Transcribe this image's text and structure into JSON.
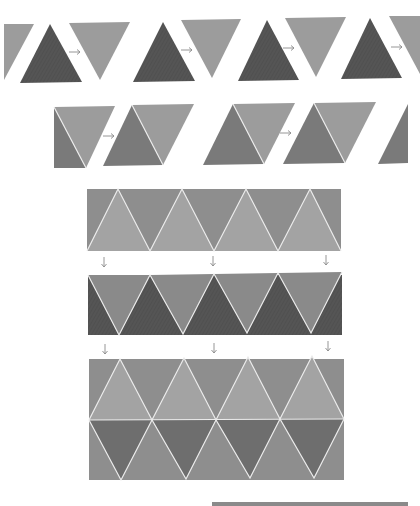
{
  "diagram": {
    "colors": {
      "light_gray": "#9c9c9c",
      "mid_gray": "#8a8a8a",
      "medium_dark": "#7a7a7a",
      "dark_gray": "#565656",
      "lighter_gray": "#a3a3a3",
      "edge_white": "#ececec",
      "arrow_gray": "#8a8a8a"
    },
    "row1": {
      "description": "Inverted triangle rotated to upright dark triangle",
      "arrow_glyph": "→",
      "pairs": 4
    },
    "row2": {
      "description": "Two triangles combined into a parallelogram",
      "arrow_glyph": "→",
      "pairs": 2
    },
    "strip1": {
      "description": "Strip of alternating light and mid-gray triangles",
      "triangles_up": 4
    },
    "down_arrows": {
      "glyph": "↓",
      "count_per_row": 3
    },
    "strip2": {
      "description": "Strip of alternating dark and light triangles",
      "triangles_down": 4
    },
    "strip3": {
      "description": "Two stacked rows forming a tessellation",
      "rows": 2
    }
  }
}
